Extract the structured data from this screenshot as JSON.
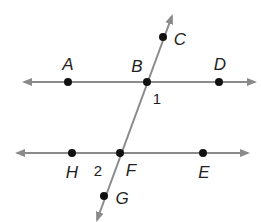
{
  "diagram": {
    "type": "parallel lines cut by a transversal",
    "colors": {
      "line": "#8a8a8a",
      "point": "#111111",
      "text": "#222222"
    },
    "lines": [
      {
        "id": "AD",
        "from": [
          24,
          82
        ],
        "to": [
          255,
          82
        ],
        "arrows": "both"
      },
      {
        "id": "HE",
        "from": [
          17,
          153
        ],
        "to": [
          248,
          153
        ],
        "arrows": "both"
      },
      {
        "id": "CG",
        "from": [
          172,
          16
        ],
        "to": [
          97,
          220
        ],
        "arrows": "both"
      }
    ],
    "points": [
      {
        "name": "A",
        "x": 68,
        "y": 82,
        "lx": 68,
        "ly": 70
      },
      {
        "name": "B",
        "x": 147,
        "y": 82,
        "lx": 137,
        "ly": 72
      },
      {
        "name": "D",
        "x": 219,
        "y": 82,
        "lx": 220,
        "ly": 70
      },
      {
        "name": "C",
        "x": 163,
        "y": 37,
        "lx": 180,
        "ly": 45
      },
      {
        "name": "H",
        "x": 72,
        "y": 153,
        "lx": 72,
        "ly": 178
      },
      {
        "name": "F",
        "x": 120,
        "y": 153,
        "lx": 131,
        "ly": 176
      },
      {
        "name": "E",
        "x": 203,
        "y": 153,
        "lx": 204,
        "ly": 178
      },
      {
        "name": "G",
        "x": 104,
        "y": 196,
        "lx": 122,
        "ly": 204
      }
    ],
    "angles": [
      {
        "label": "1",
        "x": 157,
        "y": 104
      },
      {
        "label": "2",
        "x": 98,
        "y": 176
      }
    ]
  }
}
